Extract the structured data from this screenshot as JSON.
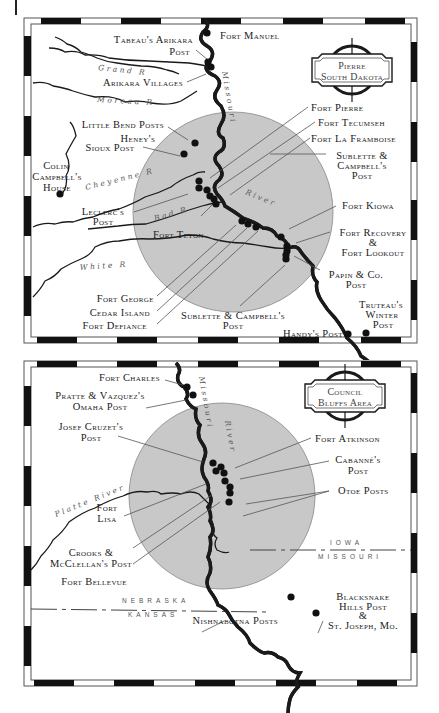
{
  "maps": [
    {
      "id": "pierre",
      "cartouche": {
        "line1": "Pierre",
        "line2": "South Dakota"
      },
      "rivers": {
        "grand": "Grand R",
        "moreau": "Moreau R",
        "cheyenne": "Cheyenne R",
        "bad": "Bad R",
        "white": "White R",
        "missouri_upper": "Missouri",
        "missouri_lower": "River"
      },
      "labels": {
        "fort_manuel": "Fort Manuel",
        "tabeau_1": "Tabeau's Arikara",
        "tabeau_2": "Post",
        "arikara_villages": "Arikara Villages",
        "little_bend": "Little Bend Posts",
        "heney_1": "Heney's",
        "heney_2": "Sioux Post",
        "colin_1": "Colin",
        "colin_2": "Campbell's",
        "colin_3": "House",
        "leclerc_1": "Leclerc's",
        "leclerc_2": "Post",
        "fort_teton": "Fort Teton",
        "fort_george": "Fort George",
        "cedar_island": "Cedar Island",
        "fort_defiance": "Fort Defiance",
        "fort_pierre": "Fort Pierre",
        "fort_tecumseh": "Fort Tecumseh",
        "fort_la_framboise": "Fort La Framboise",
        "sublette_r_1": "Sublette &",
        "sublette_r_2": "Campbell's",
        "sublette_r_3": "Post",
        "fort_kiowa": "Fort Kiowa",
        "fort_recovery_1": "Fort Recovery",
        "fort_recovery_2": "&",
        "fort_recovery_3": "Fort Lookout",
        "papin_1": "Papin & Co.",
        "papin_2": "Post",
        "sublette_b_1": "Sublette & Campbell's",
        "sublette_b_2": "Post",
        "truteau_1": "Truteau's",
        "truteau_2": "Winter",
        "truteau_3": "Post",
        "handy": "Handy's Post"
      }
    },
    {
      "id": "council-bluffs",
      "cartouche": {
        "line1": "Council",
        "line2": "Bluffs Area"
      },
      "rivers": {
        "platte": "Platte River",
        "missouri_upper": "Missouri",
        "missouri_lower": "River"
      },
      "states": {
        "nebraska": "NEBRASKA",
        "kansas": "KANSAS",
        "iowa": "IOWA",
        "missouri": "MISSOURI"
      },
      "labels": {
        "fort_charles": "Fort Charles",
        "pratte_1": "Pratte & Vazquez's",
        "pratte_2": "Omaha Post",
        "cruzet_1": "Josef Cruzet's",
        "cruzet_2": "Post",
        "fort_lisa_1": "Fort",
        "fort_lisa_2": "Lisa",
        "crooks_1": "Crooks &",
        "crooks_2": "McClellan's Post",
        "fort_bellevue": "Fort Bellevue",
        "fort_atkinson": "Fort Atkinson",
        "cabanne_1": "Cabanné's",
        "cabanne_2": "Post",
        "otoe": "Otoe Posts",
        "nishnabotna": "Nishnabotna Posts",
        "blacksnake_1": "Blacksnake",
        "blacksnake_2": "Hills Post",
        "blacksnake_3": "&",
        "blacksnake_4": "St. Joseph, Mo."
      }
    }
  ],
  "colors": {
    "circle_fill": "#c8c8c8",
    "ink": "#1a1a1a",
    "frame_dark": "#111111",
    "leader": "#555555"
  }
}
